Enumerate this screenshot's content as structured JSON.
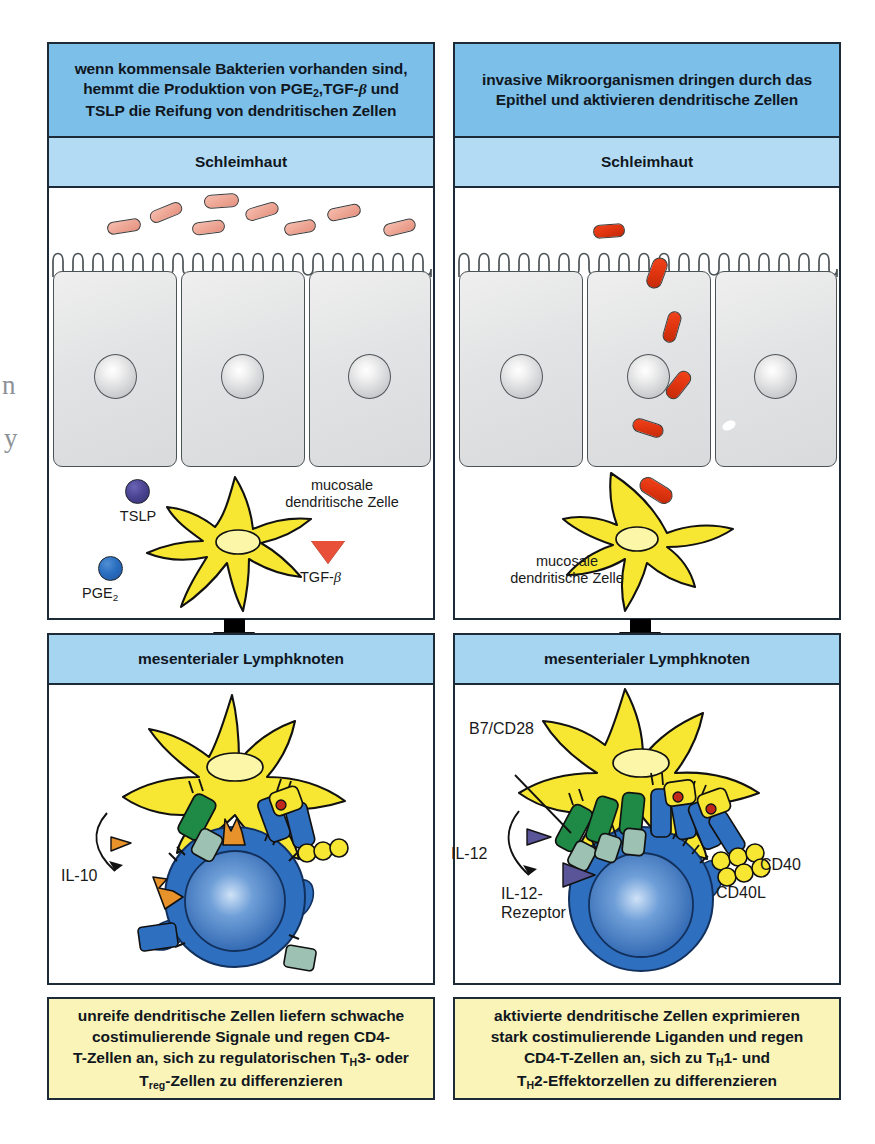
{
  "figure": {
    "colors": {
      "header_band": "#7cc0ea",
      "sub_band": "#b4dbf4",
      "lymph_band": "#a6d5f2",
      "caption_bg": "#fbf4b8",
      "frame": "#1d2b38",
      "dendritic_cell": "#f7e733",
      "t_cell": "#2f6fc0",
      "commensal_bacteria": "#eda593",
      "invasive_bacteria": "#e03410",
      "tslp_marker": "#4b4594",
      "pge2_marker": "#2a6ec0",
      "tgf_beta_marker": "#e8503a",
      "mhc_green": "#1f8a45",
      "cd40_yellow": "#f2e45c",
      "il10_orange": "#e8922b",
      "il12_purple": "#5a5499"
    }
  },
  "panels": {
    "left": {
      "header": "wenn kommensale Bakterien vorhanden sind, hemmt die Produktion von PGE2, TGF-β und TSLP die Reifung von dendritischen Zellen",
      "header_lines": [
        "wenn kommensale Bakterien vorhanden sind,",
        "hemmt die Produktion von PGE2,TGF-β und",
        "TSLP die Reifung von dendritischen Zellen"
      ],
      "mucosa_label": "Schleimhaut",
      "lymph_label": "mesenterialer Lymphknoten",
      "dc_label_lines": [
        "mucosale",
        "dendritische Zelle"
      ],
      "markers": [
        {
          "name": "TSLP",
          "shape": "circle",
          "color": "#4b4594"
        },
        {
          "name": "PGE2",
          "shape": "circle",
          "color": "#2a6ec0"
        },
        {
          "name": "TGF-β",
          "shape": "triangle-down",
          "color": "#e8503a"
        }
      ],
      "cytokine_label": "IL-10",
      "caption_lines": [
        "unreife dendritische Zellen liefern schwache",
        "costimulierende Signale und regen CD4-",
        "T-Zellen an, sich zu regulatorischen TH3- oder",
        "Treg-Zellen zu differenzieren"
      ],
      "bacteria_count": 8,
      "epithelial_cell_count": 3
    },
    "right": {
      "header": "invasive Mikroorganismen dringen durch das Epithel und aktivieren dendritische Zellen",
      "header_lines": [
        "invasive Mikroorganismen dringen durch das",
        "Epithel und aktivieren dendritische Zellen"
      ],
      "mucosa_label": "Schleimhaut",
      "lymph_label": "mesenterialer Lymphknoten",
      "dc_label_lines": [
        "mucosale",
        "dendritische Zelle"
      ],
      "labels": [
        {
          "name": "B7/CD28"
        },
        {
          "name": "IL-12"
        },
        {
          "name": "IL-12-Rezeptor",
          "lines": [
            "IL-12-",
            "Rezeptor"
          ]
        },
        {
          "name": "CD40"
        },
        {
          "name": "CD40L"
        }
      ],
      "caption_lines": [
        "aktivierte dendritische Zellen exprimieren",
        "stark costimulierende Liganden und regen",
        "CD4-T-Zellen an, sich zu TH1- und",
        "TH2-Effektorzellen zu differenzieren"
      ],
      "bacteria_count": 5,
      "epithelial_cell_count": 3
    }
  },
  "edge_bleed": {
    "glyph_top": "n",
    "glyph_bottom": "y"
  }
}
